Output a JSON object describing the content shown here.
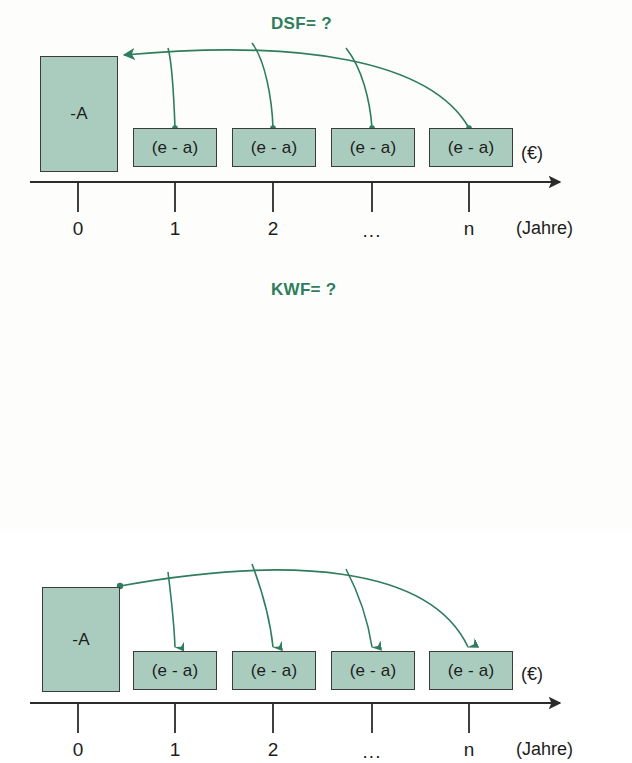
{
  "figure": {
    "accent_green": "#2f7d5d",
    "box_fill": "#a9ccbe",
    "box_stroke": "#3b3b3b",
    "axis_color": "#2b2b2b"
  },
  "diagrams": [
    {
      "id": "dsf",
      "formula_label": "DSF= ?",
      "investment_box_label": "-A",
      "flow_box_labels": [
        "(e - a)",
        "(e - a)",
        "(e - a)",
        "(e - a)"
      ],
      "axis": {
        "tick_labels": [
          "0",
          "1",
          "2",
          "...",
          "n"
        ],
        "value_unit": "(€)",
        "time_unit": "(Jahre)"
      },
      "arrow_direction": "right-to-left (discounting to t=0)"
    },
    {
      "id": "kwf",
      "formula_label": "KWF= ?",
      "investment_box_label": "-A",
      "flow_box_labels": [
        "(e - a)",
        "(e - a)",
        "(e - a)",
        "(e - a)"
      ],
      "axis": {
        "tick_labels": [
          "0",
          "1",
          "2",
          "...",
          "n"
        ],
        "value_unit": "(€)",
        "time_unit": "(Jahre)"
      },
      "arrow_direction": "left-to-right (annuity distribution)"
    }
  ]
}
